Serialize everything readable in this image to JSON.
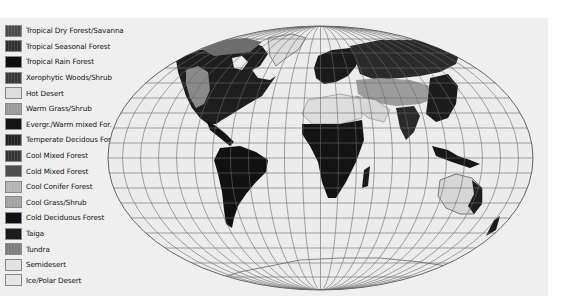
{
  "legend": {
    "items": [
      {
        "label": "Tropical Dry Forest/Savanna",
        "color": "#4a4a4a",
        "pattern": "hatch"
      },
      {
        "label": "Tropical Seasonal Forest",
        "color": "#2e2e2e",
        "pattern": "hatch"
      },
      {
        "label": "Tropical Rain Forest",
        "color": "#0e0e0e",
        "pattern": "solid"
      },
      {
        "label": "Xerophytic Woods/Shrub",
        "color": "#383838",
        "pattern": "hatch"
      },
      {
        "label": "Hot Desert",
        "color": "#dcdcdc",
        "pattern": "solid"
      },
      {
        "label": "Warm Grass/Shrub",
        "color": "#9a9a9a",
        "pattern": "hatch"
      },
      {
        "label": "Evergr./Warm mixed For.",
        "color": "#141414",
        "pattern": "solid"
      },
      {
        "label": "Temperate Decidous For.",
        "color": "#222222",
        "pattern": "hatch"
      },
      {
        "label": "Cool Mixed Forest",
        "color": "#333333",
        "pattern": "hatch"
      },
      {
        "label": "Cold Mixed Forest",
        "color": "#4e4e4e",
        "pattern": "solid"
      },
      {
        "label": "Cool Conifer Forest",
        "color": "#b4b4b4",
        "pattern": "hatch"
      },
      {
        "label": "Cool Grass/Shrub",
        "color": "#a2a2a2",
        "pattern": "hatch"
      },
      {
        "label": "Cold Deciduous Forest",
        "color": "#101010",
        "pattern": "solid"
      },
      {
        "label": "Taiga",
        "color": "#1c1c1c",
        "pattern": "solid"
      },
      {
        "label": "Tundra",
        "color": "#7c7c7c",
        "pattern": "hatch"
      },
      {
        "label": "Semidesert",
        "color": "#e2e2e2",
        "pattern": "solid"
      },
      {
        "label": "Ice/Polar Desert",
        "color": "#e6e6e6",
        "pattern": "solid"
      }
    ]
  },
  "map": {
    "projection": "Robinson-like world map with graticule",
    "background": "#efefef",
    "ocean": "#ececec",
    "graticule_color": "#6a6a6a"
  }
}
